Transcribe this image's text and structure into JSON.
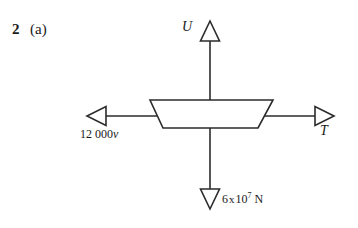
{
  "page": {
    "width": 358,
    "height": 228,
    "background_color": "#ffffff",
    "ink_color": "#2b2b2b"
  },
  "question": {
    "number": "2",
    "part": "(a)"
  },
  "diagram": {
    "body_shape": "trapezium",
    "forces": [
      {
        "id": "up",
        "symbol": "U",
        "direction": "up",
        "label": "U",
        "arrowhead": "open-triangle"
      },
      {
        "id": "right",
        "symbol": "T",
        "direction": "right",
        "label": "T",
        "arrowhead": "open-triangle"
      },
      {
        "id": "left",
        "value": "12 000",
        "unit_symbol": "v",
        "direction": "left",
        "label": "12 000v",
        "arrowhead": "open-triangle"
      },
      {
        "id": "down",
        "mantissa": "6",
        "times": "x",
        "base": "10",
        "exponent": "7",
        "unit": "N",
        "direction": "down",
        "label": "6 x 10⁷ N",
        "arrowhead": "open-triangle"
      }
    ]
  },
  "icons": {
    "arrow_up": "arrow-up-icon",
    "arrow_down": "arrow-down-icon",
    "arrow_left": "arrow-left-icon",
    "arrow_right": "arrow-right-icon"
  }
}
